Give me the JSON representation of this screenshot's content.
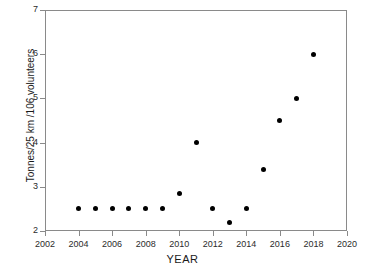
{
  "chart_data": {
    "type": "scatter",
    "title": "",
    "xlabel": "YEAR",
    "ylabel": "Tonnes/25 km /106 volunteers",
    "xlim": [
      2002,
      2020
    ],
    "ylim": [
      2,
      7
    ],
    "xticks": [
      2002,
      2004,
      2006,
      2008,
      2010,
      2012,
      2014,
      2016,
      2018,
      2020
    ],
    "yticks": [
      2,
      3,
      4,
      5,
      6,
      7
    ],
    "grid": false,
    "legend": null,
    "marker": {
      "shape": "circle",
      "color": "#000000",
      "size": 5
    },
    "x": [
      2004,
      2005,
      2006,
      2007,
      2008,
      2009,
      2010,
      2011,
      2012,
      2013,
      2014,
      2015,
      2016,
      2017,
      2018
    ],
    "y": [
      2.5,
      2.5,
      2.5,
      2.5,
      2.5,
      2.5,
      2.85,
      4.0,
      2.5,
      2.2,
      2.5,
      3.4,
      4.5,
      5.0,
      6.0
    ],
    "points": [
      {
        "x": 2004,
        "y": 2.5
      },
      {
        "x": 2005,
        "y": 2.5
      },
      {
        "x": 2006,
        "y": 2.5
      },
      {
        "x": 2007,
        "y": 2.5
      },
      {
        "x": 2008,
        "y": 2.5
      },
      {
        "x": 2009,
        "y": 2.5
      },
      {
        "x": 2010,
        "y": 2.85
      },
      {
        "x": 2011,
        "y": 4.0
      },
      {
        "x": 2012,
        "y": 2.5
      },
      {
        "x": 2013,
        "y": 2.2
      },
      {
        "x": 2014,
        "y": 2.5
      },
      {
        "x": 2015,
        "y": 3.4
      },
      {
        "x": 2016,
        "y": 4.5
      },
      {
        "x": 2017,
        "y": 5.0
      },
      {
        "x": 2018,
        "y": 6.0
      }
    ]
  },
  "colors": {
    "marker": "#000000",
    "axis": "#8a8a8a",
    "text": "#1a1a1a",
    "background": "#ffffff"
  }
}
